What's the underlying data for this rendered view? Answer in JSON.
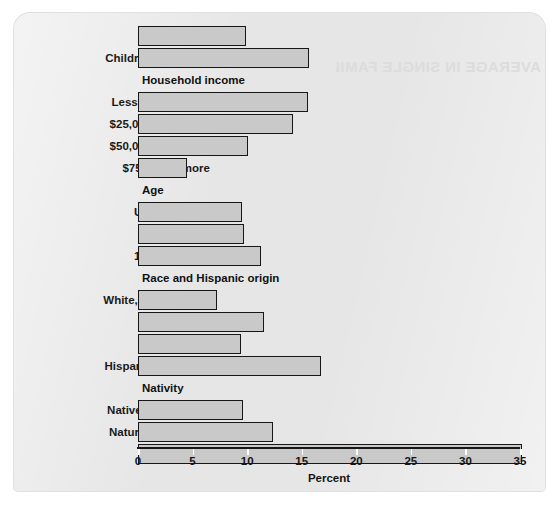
{
  "watermark_text": "AVERAGE IN SINGLE FAMILY",
  "chart_data": {
    "type": "bar",
    "orientation": "horizontal",
    "title": "",
    "xlabel": "Percent",
    "ylabel": "",
    "xlim": [
      0,
      35
    ],
    "xticks": [
      0,
      5,
      10,
      15,
      20,
      25,
      30,
      35
    ],
    "xtick_labels": [
      "0",
      "5",
      "10",
      "15",
      "20",
      "25",
      "30",
      "35"
    ],
    "grid": false,
    "legend": null,
    "bar_color": "#c9c9c9",
    "bar_edge_color": "#171717",
    "categories": [
      "All children",
      "Children in poverty",
      "Less than $25,000",
      "$25,000 to $49,999",
      "$50,000 to $74,999",
      "$75,000 or more",
      "Under 6 years",
      "6 to 11 years",
      "12 to 17 years",
      "White, not Hispanic",
      "Black",
      "Asian",
      "Hispanic (any race)",
      "Native-born citizen",
      "Naturalized citizen",
      "Noncitizen"
    ],
    "values": [
      9.9,
      15.7,
      15.6,
      14.2,
      10.1,
      4.5,
      9.5,
      9.7,
      11.3,
      7.2,
      11.5,
      9.4,
      16.8,
      9.6,
      12.4,
      35.2
    ],
    "group_headers": [
      "Household income",
      "Age",
      "Race and Hispanic origin",
      "Nativity"
    ],
    "rows": [
      {
        "kind": "bar",
        "label": "All children",
        "value": 9.9
      },
      {
        "kind": "bar",
        "label": "Children in poverty",
        "value": 15.7
      },
      {
        "kind": "header",
        "label": "Household income"
      },
      {
        "kind": "bar",
        "label": "Less than $25,000",
        "value": 15.6
      },
      {
        "kind": "bar",
        "label": "$25,000 to $49,999",
        "value": 14.2
      },
      {
        "kind": "bar",
        "label": "$50,000 to $74,999",
        "value": 10.1
      },
      {
        "kind": "bar",
        "label": "$75,000 or more",
        "value": 4.5
      },
      {
        "kind": "header",
        "label": "Age"
      },
      {
        "kind": "bar",
        "label": "Under 6 years",
        "value": 9.5
      },
      {
        "kind": "bar",
        "label": "6 to 11 years",
        "value": 9.7
      },
      {
        "kind": "bar",
        "label": "12 to 17 years",
        "value": 11.3
      },
      {
        "kind": "header",
        "label": "Race and Hispanic origin"
      },
      {
        "kind": "bar",
        "label": "White, not Hispanic",
        "value": 7.2
      },
      {
        "kind": "bar",
        "label": "Black",
        "value": 11.5
      },
      {
        "kind": "bar",
        "label": "Asian",
        "value": 9.4
      },
      {
        "kind": "bar",
        "label": "Hispanic (any race)",
        "value": 16.8
      },
      {
        "kind": "header",
        "label": "Nativity"
      },
      {
        "kind": "bar",
        "label": "Native-born citizen",
        "value": 9.6
      },
      {
        "kind": "bar",
        "label": "Naturalized citizen",
        "value": 12.4
      },
      {
        "kind": "bar",
        "label": "Noncitizen",
        "value": 35.2
      }
    ]
  }
}
